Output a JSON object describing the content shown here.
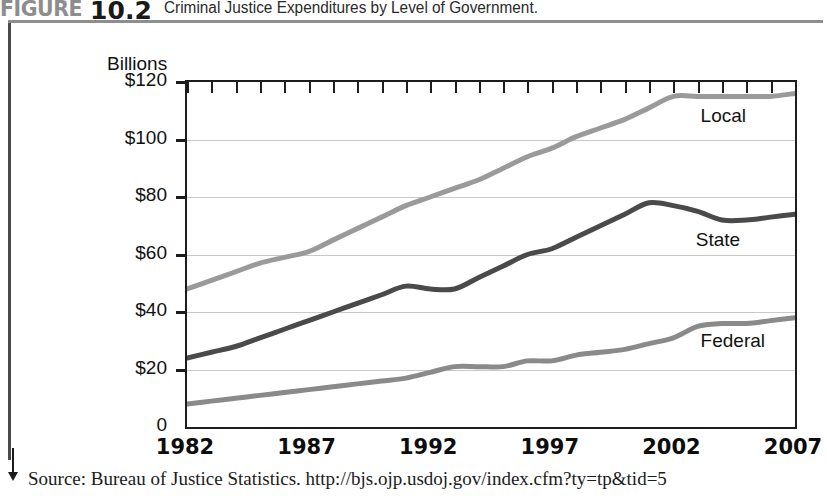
{
  "figure": {
    "label": "FIGURE",
    "number": "10.2",
    "caption": "Criminal Justice Expenditures by Level of Government."
  },
  "source": {
    "text": "Source: Bureau of Justice Statistics. http://bjs.ojp.usdoj.gov/index.cfm?ty=tp&tid=5",
    "arrow_icon": "down-arrow-icon"
  },
  "colors": {
    "local": "#9a9a9a",
    "state": "#4a4a4a",
    "federal": "#8a8a8a",
    "grid": "#c9c9c9",
    "axis": "#1d1d1d",
    "header_accent": "#8d8d8d"
  },
  "chart_data": {
    "type": "line",
    "title": "Criminal Justice Expenditures by Level of Government.",
    "subtitle": "",
    "xlabel": "",
    "ylabel": "Billions",
    "ylim": [
      0,
      120
    ],
    "xlim": [
      1982,
      2007
    ],
    "grid": true,
    "legend_position": "inline-right",
    "ytick_labels": [
      "$120",
      "$100",
      "$80",
      "$60",
      "$40",
      "$20",
      "0"
    ],
    "ytick_values": [
      120,
      100,
      80,
      60,
      40,
      20,
      0
    ],
    "xtick_values": [
      1982,
      1983,
      1984,
      1985,
      1986,
      1987,
      1988,
      1989,
      1990,
      1991,
      1992,
      1993,
      1994,
      1995,
      1996,
      1997,
      1998,
      1999,
      2000,
      2001,
      2002,
      2003,
      2004,
      2005,
      2006,
      2007
    ],
    "xtick_labels": [
      "1982",
      "1987",
      "1992",
      "1997",
      "2002",
      "2007"
    ],
    "xtick_label_values": [
      1982,
      1987,
      1992,
      1997,
      2002,
      2007
    ],
    "x": [
      1982,
      1983,
      1984,
      1985,
      1986,
      1987,
      1988,
      1989,
      1990,
      1991,
      1992,
      1993,
      1994,
      1995,
      1996,
      1997,
      1998,
      1999,
      2000,
      2001,
      2002,
      2003,
      2004,
      2005,
      2006,
      2007
    ],
    "series": [
      {
        "name": "Local",
        "color": "#9a9a9a",
        "label_x": 2003.2,
        "label_y": 107,
        "values": [
          48,
          51,
          54,
          57,
          59,
          61,
          65,
          69,
          73,
          77,
          80,
          83,
          86,
          90,
          94,
          97,
          101,
          104,
          107,
          111,
          115,
          115,
          115,
          115,
          115,
          116
        ]
      },
      {
        "name": "State",
        "color": "#4a4a4a",
        "label_x": 2003.0,
        "label_y": 64,
        "values": [
          24,
          26,
          28,
          31,
          34,
          37,
          40,
          43,
          46,
          49,
          48,
          48,
          52,
          56,
          60,
          62,
          66,
          70,
          74,
          78,
          77,
          75,
          72,
          72,
          73,
          74
        ]
      },
      {
        "name": "Federal",
        "color": "#8a8a8a",
        "label_x": 2003.2,
        "label_y": 29,
        "values": [
          8,
          9,
          10,
          11,
          12,
          13,
          14,
          15,
          16,
          17,
          19,
          21,
          21,
          21,
          23,
          23,
          25,
          26,
          27,
          29,
          31,
          35,
          36,
          36,
          37,
          38
        ]
      }
    ]
  }
}
